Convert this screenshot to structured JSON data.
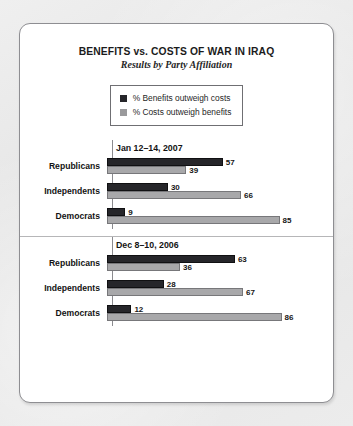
{
  "chart_data": {
    "type": "bar",
    "title": "BENEFITS vs. COSTS OF WAR IN IRAQ",
    "subtitle": "Results by Party Affiliation",
    "orientation": "horizontal",
    "xlabel": "",
    "ylabel": "",
    "xlim": [
      0,
      100
    ],
    "grid": false,
    "legend_position": "top-center",
    "legend": [
      {
        "label": "% Benefits outweigh costs",
        "color": "#26262a",
        "swatch": "dark-swatch"
      },
      {
        "label": "% Costs outweigh benefits",
        "color": "#a8a8aa",
        "swatch": "light-swatch"
      }
    ],
    "panels": [
      {
        "date": "Jan 12–14, 2007",
        "categories": [
          "Republicans",
          "Independents",
          "Democrats"
        ],
        "series": [
          {
            "name": "% Benefits outweigh costs",
            "values": [
              57,
              30,
              9
            ]
          },
          {
            "name": "% Costs outweigh benefits",
            "values": [
              39,
              66,
              85
            ]
          }
        ]
      },
      {
        "date": "Dec 8–10, 2006",
        "categories": [
          "Republicans",
          "Independents",
          "Democrats"
        ],
        "series": [
          {
            "name": "% Benefits outweigh costs",
            "values": [
              63,
              28,
              12
            ]
          },
          {
            "name": "% Costs outweigh benefits",
            "values": [
              36,
              67,
              86
            ]
          }
        ]
      }
    ]
  },
  "colors": {
    "benefits": "#26262a",
    "costs": "#a8a8aa",
    "card_border": "#8e8e92",
    "axis": "#8b8b8f",
    "page_background": "#e9e9e9"
  }
}
